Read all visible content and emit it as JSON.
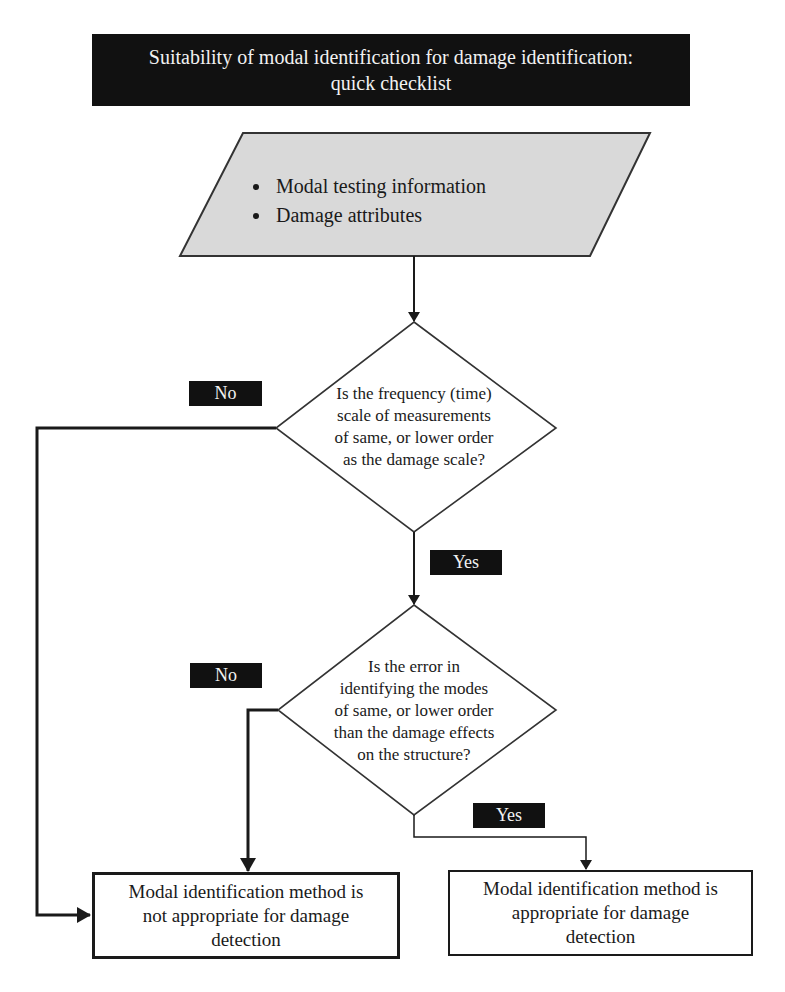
{
  "title": {
    "line1": "Suitability of modal identification for damage identification:",
    "line2": "quick checklist"
  },
  "input": {
    "items": [
      "Modal testing information",
      "Damage attributes"
    ]
  },
  "decisions": [
    {
      "id": "frequency-scale",
      "lines": [
        "Is the frequency (time)",
        "scale of measurements",
        "of same, or lower order",
        "as the damage scale?"
      ],
      "no_label": "No",
      "yes_label": "Yes"
    },
    {
      "id": "mode-error",
      "lines": [
        "Is the error in",
        "identifying the modes",
        "of same, or lower order",
        "than the damage effects",
        "on the structure?"
      ],
      "no_label": "No",
      "yes_label": "Yes"
    }
  ],
  "outcomes": {
    "negative": {
      "lines": [
        "Modal identification method is",
        "not appropriate for damage",
        "detection"
      ]
    },
    "positive": {
      "lines": [
        "Modal identification method is",
        "appropriate for damage",
        "detection"
      ]
    }
  },
  "colors": {
    "banner": "#111111",
    "banner_text": "#f2f2f2",
    "input_fill": "#d9d9d9",
    "line": "#1a1a1a",
    "badge": "#111111"
  }
}
